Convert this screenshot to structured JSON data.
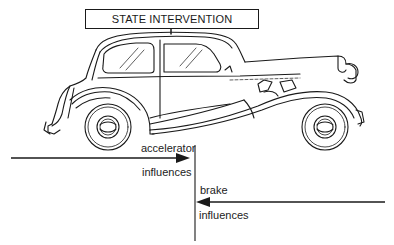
{
  "title_box": {
    "label": "STATE INTERVENTION"
  },
  "car": {
    "icon": "vintage-car-illustration",
    "description": "Line drawing of a vintage sedan (Citroen Traction Avant style)"
  },
  "arrows": {
    "accelerator": {
      "label_top": "accelerator",
      "label_bottom": "influences",
      "direction": "right"
    },
    "brake": {
      "label_top": "brake",
      "label_bottom": "influences",
      "direction": "left"
    }
  },
  "colors": {
    "ink": "#1a1a1a",
    "background": "#ffffff"
  }
}
